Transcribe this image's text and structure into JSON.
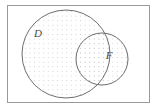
{
  "figure": {
    "type": "venn-diagram",
    "background_color": "#ffffff",
    "frame": {
      "label": "",
      "x": 7,
      "y": 5,
      "width": 143,
      "height": 98,
      "stroke_color": "#9a9a9a",
      "stroke_width": 1,
      "fill": "none"
    },
    "fill_pattern": {
      "name": "dot-grid",
      "dot_color": "#c9c9c9",
      "dot_radius": 0.55,
      "spacing": 4.6
    },
    "sets": [
      {
        "id": "set-d",
        "label": "D",
        "cx": 66,
        "cy": 54,
        "r": 44,
        "stroke_color": "#6e6e6e",
        "stroke_width": 1,
        "shaded": true,
        "label_x": 38,
        "label_y": 34,
        "label_color": "#4a4a4a"
      },
      {
        "id": "set-f",
        "label": "F",
        "cx": 102,
        "cy": 59,
        "r": 26,
        "stroke_color": "#6e6e6e",
        "stroke_width": 1,
        "shaded": true,
        "label_x": 109,
        "label_y": 56,
        "label_color": "#4a4a4a"
      }
    ]
  }
}
